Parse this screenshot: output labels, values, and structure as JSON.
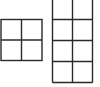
{
  "diagram": {
    "line_color": "#2a2a2a",
    "background": "#ffffff",
    "grids": [
      {
        "name": "left-grid",
        "columns": 2,
        "rows": 2,
        "x": 1,
        "y": 19.5,
        "cell": 20.5
      },
      {
        "name": "right-grid",
        "columns": 2,
        "rows": 4,
        "x": 52.5,
        "y": -2,
        "cell": 20.5,
        "top_border": false
      }
    ]
  }
}
